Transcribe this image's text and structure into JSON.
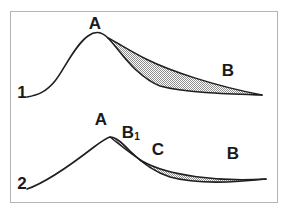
{
  "figure": {
    "background_color": "#ffffff",
    "frame": {
      "name": "figure-border",
      "color": "#b4b4b4",
      "x": 10,
      "y": 11,
      "width": 268,
      "height": 192,
      "stroke_width": 1
    },
    "ink_color": "#1f1f1f",
    "shade_color": "#9a9a9a",
    "shade_pattern": "fine-checker-dither",
    "curves": [
      {
        "id": "curve-1",
        "index_label": "1",
        "index_label_x": 22,
        "index_label_y": 98,
        "labels": [
          {
            "name": "label-a-upper",
            "text": "A",
            "x": 95,
            "y": 29
          },
          {
            "name": "label-b-upper",
            "text": "B",
            "x": 228,
            "y": 76
          }
        ],
        "shaded_region": {
          "name": "shaded-lens-upper",
          "opens_at": "A",
          "closes_at": "B",
          "relative_area": "large"
        },
        "main_path": "M 27,97 C 38,95 46,92 55,81 C 64,70 74,46 88,36 C 95,31 101,31 108,38 C 116,46 124,59 136,70 C 146,79 152,83 160,86 C 185,93 230,94 262,95",
        "branch_path": "M 108,38 C 118,43 130,51 146,59 C 170,71 215,86 262,95"
      },
      {
        "id": "curve-2",
        "index_label": "2",
        "index_label_x": 22,
        "index_label_y": 189,
        "labels": [
          {
            "name": "label-a-lower",
            "text": "A",
            "x": 101,
            "y": 125
          },
          {
            "name": "label-b1-lower",
            "text": "B",
            "sub": "1",
            "x": 128,
            "y": 138
          },
          {
            "name": "label-c-lower",
            "text": "C",
            "x": 158,
            "y": 155
          },
          {
            "name": "label-b-lower",
            "text": "B",
            "x": 233,
            "y": 159
          }
        ],
        "shaded_region": {
          "name": "shaded-lens-lower",
          "opens_at": "B1",
          "closes_at": "B",
          "relative_area": "small"
        },
        "main_path": "M 27,189 C 45,183 72,164 94,147 C 102,141 106,138 110,137 C 116,137 122,143 130,151 C 142,163 154,172 170,177 C 195,184 230,183 266,179",
        "branch_path": "M 110,137 C 118,143 128,152 142,161 C 168,176 220,182 266,179"
      }
    ]
  }
}
